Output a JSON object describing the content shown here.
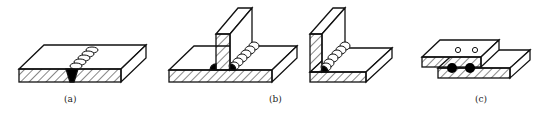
{
  "figure": {
    "panels": [
      {
        "id": "a",
        "label": "(a)",
        "joint": "butt joint"
      },
      {
        "id": "b",
        "label": "(b)",
        "joint": "T-joint and corner joint"
      },
      {
        "id": "c",
        "label": "(c)",
        "joint": "lap joint (spot welds)"
      }
    ]
  },
  "colors": {
    "line": "#111111",
    "background": "#ffffff",
    "weld": "#000000"
  }
}
